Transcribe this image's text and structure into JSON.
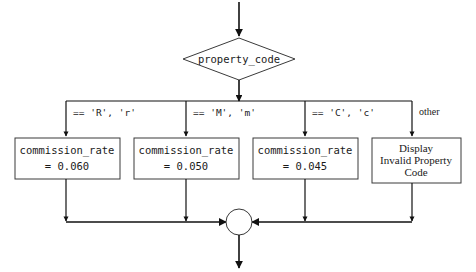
{
  "diagram": {
    "type": "flowchart",
    "colors": {
      "background": "#ffffff",
      "shape_stroke": "#3a3a3a",
      "shape_fill": "#ffffff",
      "connector": "#111111",
      "text": "#1a1a1a"
    },
    "decision": {
      "label": "property_code",
      "shape": "diamond"
    },
    "branches": [
      {
        "edge_label": "== 'R', 'r'",
        "box_line1": "commission_rate",
        "box_line2": "= 0.060",
        "value": 0.06
      },
      {
        "edge_label": "== 'M', 'm'",
        "box_line1": "commission_rate",
        "box_line2": "= 0.050",
        "value": 0.05
      },
      {
        "edge_label": "== 'C', 'c'",
        "box_line1": "commission_rate",
        "box_line2": "= 0.045",
        "value": 0.045
      },
      {
        "edge_label": "other",
        "box_line1": "Display",
        "box_line2": "Invalid Property",
        "box_line3": "Code",
        "value": null
      }
    ],
    "merge": {
      "label": "",
      "shape": "circle"
    }
  }
}
